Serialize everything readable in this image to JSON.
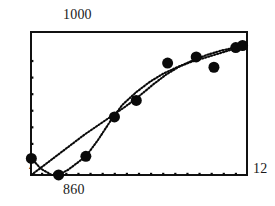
{
  "chart_data": {
    "type": "scatter",
    "title": "",
    "xlabel": "",
    "ylabel": "",
    "xlim": [
      4,
      12
    ],
    "ylim": [
      860,
      1000
    ],
    "grid": false,
    "legend": null,
    "axis_labels": {
      "y_max": "1000",
      "y_min": "4",
      "x_min": "860",
      "x_max": "12"
    },
    "x_ticks": [
      4.444,
      4.889,
      5.333,
      5.778,
      6.222,
      6.667,
      7.111,
      7.556,
      8.0,
      8.444,
      8.889,
      9.333,
      9.778,
      10.222,
      10.667,
      11.111,
      11.556
    ],
    "y_ticks": [
      875,
      891,
      907,
      923,
      939,
      955,
      971
    ],
    "points": [
      {
        "x": 4.05,
        "y": 877
      },
      {
        "x": 5.05,
        "y": 861
      },
      {
        "x": 6.05,
        "y": 879
      },
      {
        "x": 7.1,
        "y": 917
      },
      {
        "x": 7.9,
        "y": 933
      },
      {
        "x": 9.05,
        "y": 969
      },
      {
        "x": 10.1,
        "y": 975
      },
      {
        "x": 10.75,
        "y": 965
      },
      {
        "x": 11.55,
        "y": 984
      },
      {
        "x": 11.8,
        "y": 986
      }
    ],
    "series": [
      {
        "name": "sigmoid-fit",
        "style": "dotted-curve",
        "x": [
          4.05,
          4.4,
          4.8,
          5.05,
          5.4,
          5.8,
          6.05,
          6.5,
          7.0,
          7.4,
          7.9,
          8.4,
          8.9,
          9.4,
          9.9,
          10.4,
          10.9,
          11.4,
          11.85
        ],
        "y": [
          877,
          867,
          861,
          861,
          866,
          874,
          879,
          895,
          915,
          929,
          941,
          951,
          959,
          965,
          970,
          974,
          978,
          982,
          986
        ]
      },
      {
        "name": "smooth-fit",
        "style": "dotted-curve",
        "x": [
          4.05,
          4.5,
          5.0,
          5.5,
          6.0,
          6.5,
          7.0,
          7.5,
          8.0,
          8.5,
          9.0,
          9.5,
          10.0,
          10.5,
          11.0,
          11.5,
          11.85
        ],
        "y": [
          861,
          870,
          880,
          890,
          900,
          909,
          918,
          927,
          937,
          948,
          958,
          966,
          972,
          977,
          981,
          984,
          986
        ]
      }
    ],
    "marker": {
      "shape": "circle",
      "color": "#0a0a0a",
      "size": 11
    },
    "line_color": "#0a0a0a",
    "frame_color": "#111111"
  }
}
